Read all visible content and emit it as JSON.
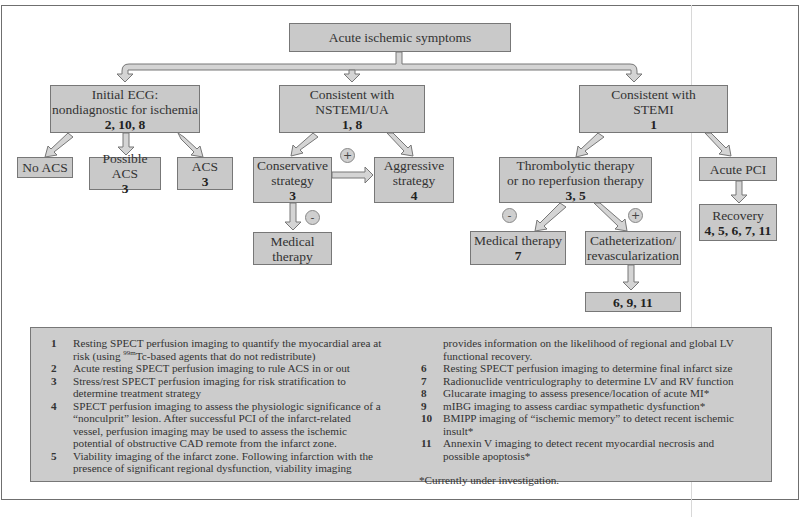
{
  "diagram": {
    "root": {
      "label": "Acute ischemic symptoms"
    },
    "branches": {
      "ecg": {
        "line1": "Initial ECG:",
        "line2": "nondiagnostic for ischemia",
        "refs": "2, 10, 8"
      },
      "nstemi": {
        "line1": "Consistent with",
        "line2": "NSTEMI/UA",
        "refs": "1, 8"
      },
      "stemi": {
        "line1": "Consistent with",
        "line2": "STEMI",
        "refs": "1"
      }
    },
    "ecg_children": {
      "no_acs": {
        "label": "No ACS"
      },
      "possible_acs": {
        "label": "Possible ACS",
        "refs": "3"
      },
      "acs": {
        "label": "ACS",
        "refs": "3"
      }
    },
    "nstemi_children": {
      "conservative": {
        "line1": "Conservative",
        "line2": "strategy",
        "refs": "3"
      },
      "aggressive": {
        "line1": "Aggressive",
        "line2": "strategy",
        "refs": "4"
      },
      "medical": {
        "line1": "Medical",
        "line2": "therapy"
      },
      "plus_sign": "+",
      "minus_sign": "-"
    },
    "stemi_children": {
      "thrombolytic": {
        "line1": "Thrombolytic therapy",
        "line2": "or no reperfusion therapy",
        "refs": "3, 5"
      },
      "acute_pci": {
        "label": "Acute PCI"
      },
      "recovery": {
        "label": "Recovery",
        "refs": "4, 5, 6, 7, 11"
      },
      "medical": {
        "label": "Medical therapy",
        "refs": "7"
      },
      "cath": {
        "line1": "Catheterization/",
        "line2": "revascularization"
      },
      "cath_refs": {
        "refs": "6, 9, 11"
      },
      "minus_sign": "-",
      "plus_sign": "+"
    }
  },
  "legend": {
    "left": [
      {
        "num": "1",
        "text": "Resting SPECT perfusion imaging to quantify the myocardial area at",
        "cont_pre": "risk (using ",
        "cont_sup": "99m",
        "cont_post": "Tc-based agents that do not redistribute)"
      },
      {
        "num": "2",
        "text": "Acute resting SPECT perfusion imaging to rule ACS in or out"
      },
      {
        "num": "3",
        "text": "Stress/rest SPECT perfusion imaging for risk stratification to",
        "cont": "determine treatment strategy"
      },
      {
        "num": "4",
        "text": "SPECT perfusion imaging to assess the physiologic significance of a",
        "cont": "“nonculprit” lesion. After successful PCI of the infarct-related",
        "cont2": "vessel, perfusion imaging may be used to assess the ischemic",
        "cont3": "potential of obstructive CAD remote from the infarct zone."
      },
      {
        "num": "5",
        "text": "Viability imaging of the infarct zone. Following infarction with the",
        "cont": "presence of significant regional dysfunction, viability imaging"
      }
    ],
    "right_cont": {
      "line1": "provides information on the likelihood of regional and global LV",
      "line2": "functional recovery."
    },
    "right": [
      {
        "num": "6",
        "text": "Resting SPECT perfusion imaging to determine final infarct size"
      },
      {
        "num": "7",
        "text": "Radionuclide ventriculography to determine LV and RV function"
      },
      {
        "num": "8",
        "text": "Glucarate imaging to assess presence/location of acute MI*"
      },
      {
        "num": "9",
        "text": "mIBG imaging to assess cardiac sympathetic dysfunction*"
      },
      {
        "num": "10",
        "text": "BMIPP imaging of “ischemic memory” to detect recent ischemic",
        "cont": "insult*"
      },
      {
        "num": "11",
        "text": "Annexin V imaging to detect recent myocardial necrosis and",
        "cont": "possible apoptosis*"
      }
    ],
    "footnote": "*Currently under investigation."
  }
}
